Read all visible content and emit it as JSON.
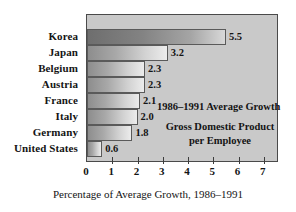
{
  "chart_data": {
    "type": "bar",
    "orientation": "horizontal",
    "title": "",
    "categories": [
      "Korea",
      "Japan",
      "Belgium",
      "Austria",
      "France",
      "Italy",
      "Germany",
      "United States"
    ],
    "values": [
      5.5,
      3.2,
      2.3,
      2.3,
      2.1,
      2.0,
      1.8,
      0.6
    ],
    "value_labels": [
      "5.5",
      "3.2",
      "2.3",
      "2.3",
      "2.1",
      "2.0",
      "1.8",
      "0.6"
    ],
    "xlabel": "Percentage of Average Growth, 1986–1991",
    "ylabel": "",
    "xlim": [
      0,
      7.6
    ],
    "xticks": [
      0,
      1,
      2,
      3,
      4,
      5,
      6,
      7
    ],
    "xtick_labels": [
      "0",
      "1",
      "2",
      "3",
      "4",
      "5",
      "6",
      "7"
    ],
    "grid": false,
    "legend": "none",
    "annotations": [
      "1986–1991 Average Growth",
      "Gross Domestic Product per Employee"
    ],
    "highlight_category": "Korea",
    "colors": {
      "plot_background": "#c9c9c9",
      "frame_border": "#4a4a4a",
      "bar_gradient_start": "#8d8d8d",
      "bar_gradient_end": "#ececec",
      "highlight_bar_start": "#6e6e6e",
      "text": "#141414",
      "page_background": "#ffffff"
    }
  },
  "annotation_lines": {
    "growth": "1986–1991 Average Growth",
    "gdp_line1": "Gross Domestic Product",
    "gdp_line2": "per Employee"
  }
}
